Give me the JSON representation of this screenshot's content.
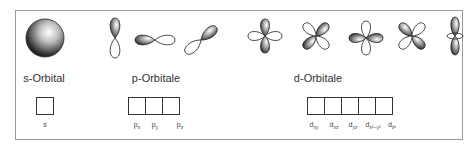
{
  "groups": {
    "s": {
      "label": "s-Orbital",
      "orbitals": [
        "s"
      ],
      "boxes": 1
    },
    "p": {
      "label": "p-Orbitale",
      "orbitals": [
        {
          "base": "p",
          "sub": "x"
        },
        {
          "base": "p",
          "sub": "y"
        },
        {
          "base": "p",
          "sub": "z"
        }
      ],
      "boxes": 3
    },
    "d": {
      "label": "d-Orbitale",
      "orbitals": [
        {
          "base": "d",
          "sub": "xy"
        },
        {
          "base": "d",
          "sub": "xz"
        },
        {
          "base": "d",
          "sub": "yz"
        },
        {
          "base": "d",
          "sub": "x²−y²"
        },
        {
          "base": "d",
          "sub": "z²"
        }
      ],
      "boxes": 5
    }
  },
  "colors": {
    "frame": "#9a9a9a",
    "lobe_dark": "#2a2a2a",
    "lobe_light": "#ffffff",
    "text": "#333333"
  }
}
